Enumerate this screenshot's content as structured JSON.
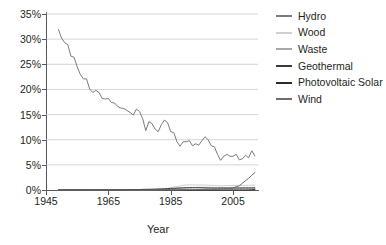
{
  "chart_data": {
    "type": "line",
    "title": "",
    "xlabel": "Year",
    "ylabel": "",
    "xlim": [
      1945,
      2013
    ],
    "ylim": [
      0,
      0.35
    ],
    "ylim_display": [
      "0%",
      "35%"
    ],
    "grid": true,
    "grid_axis": "y",
    "legend_position": "right",
    "ytick_labels": [
      "35%",
      "30%",
      "25%",
      "20%",
      "15%",
      "10%",
      "5%",
      "0%"
    ],
    "ytick_values": [
      35,
      30,
      25,
      20,
      15,
      10,
      5,
      0
    ],
    "xtick_labels": [
      "1945",
      "1965",
      "1985",
      "2005"
    ],
    "xtick_values": [
      1945,
      1965,
      1985,
      2005
    ],
    "x": [
      1949,
      1950,
      1951,
      1952,
      1953,
      1954,
      1955,
      1956,
      1957,
      1958,
      1959,
      1960,
      1961,
      1962,
      1963,
      1964,
      1965,
      1966,
      1967,
      1968,
      1969,
      1970,
      1971,
      1972,
      1973,
      1974,
      1975,
      1976,
      1977,
      1978,
      1979,
      1980,
      1981,
      1982,
      1983,
      1984,
      1985,
      1986,
      1987,
      1988,
      1989,
      1990,
      1991,
      1992,
      1993,
      1994,
      1995,
      1996,
      1997,
      1998,
      1999,
      2000,
      2001,
      2002,
      2003,
      2004,
      2005,
      2006,
      2007,
      2008,
      2009,
      2010,
      2011,
      2012
    ],
    "series": [
      {
        "name": "Hydro",
        "color": "#7b7b7b",
        "values": [
          31.9,
          30.2,
          29.3,
          28.9,
          26.6,
          26.4,
          24.5,
          23.0,
          22.1,
          22.1,
          20.1,
          19.4,
          19.8,
          19.4,
          18.2,
          18.1,
          18.2,
          17.4,
          17.3,
          16.6,
          16.3,
          16.2,
          15.8,
          15.4,
          14.9,
          16.1,
          15.6,
          14.2,
          11.8,
          13.6,
          13.2,
          12.1,
          11.6,
          13.0,
          13.9,
          13.4,
          11.6,
          11.4,
          9.6,
          8.7,
          9.6,
          9.6,
          9.8,
          8.8,
          9.2,
          8.9,
          9.8,
          10.6,
          10.0,
          8.8,
          8.6,
          7.1,
          5.9,
          6.7,
          7.1,
          6.7,
          6.7,
          7.1,
          6.0,
          6.2,
          6.9,
          6.4,
          7.8,
          6.8
        ]
      },
      {
        "name": "Wood",
        "color": "#cfcfcf",
        "values": [
          0.05,
          0.05,
          0.05,
          0.05,
          0.05,
          0.05,
          0.05,
          0.05,
          0.05,
          0.05,
          0.05,
          0.05,
          0.05,
          0.05,
          0.05,
          0.05,
          0.05,
          0.05,
          0.05,
          0.05,
          0.05,
          0.05,
          0.05,
          0.05,
          0.05,
          0.05,
          0.05,
          0.05,
          0.05,
          0.06,
          0.06,
          0.08,
          0.1,
          0.15,
          0.2,
          0.3,
          0.45,
          0.6,
          0.7,
          0.8,
          0.95,
          1.0,
          1.02,
          1.0,
          0.98,
          0.98,
          1.0,
          0.98,
          0.95,
          0.92,
          0.9,
          0.88,
          0.82,
          0.85,
          0.88,
          0.9,
          0.9,
          0.92,
          0.93,
          0.92,
          0.9,
          0.92,
          0.95,
          0.98
        ]
      },
      {
        "name": "Waste",
        "color": "#a8a8a8",
        "values": [
          0.0,
          0.0,
          0.0,
          0.0,
          0.0,
          0.0,
          0.0,
          0.0,
          0.0,
          0.0,
          0.0,
          0.0,
          0.0,
          0.0,
          0.0,
          0.0,
          0.0,
          0.0,
          0.0,
          0.0,
          0.0,
          0.0,
          0.0,
          0.0,
          0.0,
          0.0,
          0.0,
          0.0,
          0.0,
          0.0,
          0.01,
          0.02,
          0.03,
          0.05,
          0.08,
          0.12,
          0.18,
          0.25,
          0.3,
          0.35,
          0.4,
          0.42,
          0.45,
          0.48,
          0.5,
          0.52,
          0.53,
          0.52,
          0.52,
          0.52,
          0.5,
          0.5,
          0.48,
          0.48,
          0.48,
          0.47,
          0.46,
          0.46,
          0.45,
          0.45,
          0.44,
          0.44,
          0.44,
          0.43
        ]
      },
      {
        "name": "Geothermal",
        "color": "#3a3a3a",
        "values": [
          0.0,
          0.0,
          0.0,
          0.0,
          0.0,
          0.0,
          0.0,
          0.0,
          0.0,
          0.0,
          0.0,
          0.01,
          0.01,
          0.01,
          0.01,
          0.01,
          0.02,
          0.02,
          0.03,
          0.03,
          0.04,
          0.05,
          0.06,
          0.07,
          0.08,
          0.09,
          0.1,
          0.12,
          0.14,
          0.15,
          0.16,
          0.18,
          0.2,
          0.22,
          0.25,
          0.28,
          0.33,
          0.35,
          0.38,
          0.4,
          0.42,
          0.44,
          0.45,
          0.45,
          0.45,
          0.44,
          0.42,
          0.4,
          0.38,
          0.37,
          0.36,
          0.36,
          0.37,
          0.36,
          0.36,
          0.36,
          0.37,
          0.38,
          0.38,
          0.38,
          0.4,
          0.39,
          0.4,
          0.41
        ]
      },
      {
        "name": "Photovoltaic Solar",
        "color": "#2b2b2b",
        "values": [
          0.0,
          0.0,
          0.0,
          0.0,
          0.0,
          0.0,
          0.0,
          0.0,
          0.0,
          0.0,
          0.0,
          0.0,
          0.0,
          0.0,
          0.0,
          0.0,
          0.0,
          0.0,
          0.0,
          0.0,
          0.0,
          0.0,
          0.0,
          0.0,
          0.0,
          0.0,
          0.0,
          0.0,
          0.0,
          0.0,
          0.0,
          0.0,
          0.0,
          0.0,
          0.0,
          0.01,
          0.01,
          0.01,
          0.01,
          0.01,
          0.01,
          0.01,
          0.01,
          0.01,
          0.01,
          0.01,
          0.01,
          0.01,
          0.01,
          0.01,
          0.02,
          0.02,
          0.02,
          0.02,
          0.02,
          0.02,
          0.02,
          0.02,
          0.02,
          0.02,
          0.02,
          0.03,
          0.05,
          0.11
        ]
      },
      {
        "name": "Wind",
        "color": "#6e6e6e",
        "values": [
          0.0,
          0.0,
          0.0,
          0.0,
          0.0,
          0.0,
          0.0,
          0.0,
          0.0,
          0.0,
          0.0,
          0.0,
          0.0,
          0.0,
          0.0,
          0.0,
          0.0,
          0.0,
          0.0,
          0.0,
          0.0,
          0.0,
          0.0,
          0.0,
          0.0,
          0.0,
          0.0,
          0.0,
          0.0,
          0.0,
          0.0,
          0.0,
          0.0,
          0.0,
          0.01,
          0.02,
          0.02,
          0.03,
          0.04,
          0.03,
          0.07,
          0.09,
          0.08,
          0.08,
          0.09,
          0.09,
          0.09,
          0.09,
          0.09,
          0.09,
          0.12,
          0.15,
          0.19,
          0.27,
          0.29,
          0.36,
          0.44,
          0.65,
          0.83,
          1.35,
          1.86,
          2.32,
          2.93,
          3.46
        ]
      }
    ]
  },
  "legend": {
    "items": [
      {
        "label": "Hydro",
        "color": "#7b7b7b"
      },
      {
        "label": "Wood",
        "color": "#cfcfcf"
      },
      {
        "label": "Waste",
        "color": "#a8a8a8"
      },
      {
        "label": "Geothermal",
        "color": "#3a3a3a"
      },
      {
        "label": "Photovoltaic Solar",
        "color": "#2b2b2b"
      },
      {
        "label": "Wind",
        "color": "#6e6e6e"
      }
    ]
  },
  "axes": {
    "x_title": "Year"
  }
}
